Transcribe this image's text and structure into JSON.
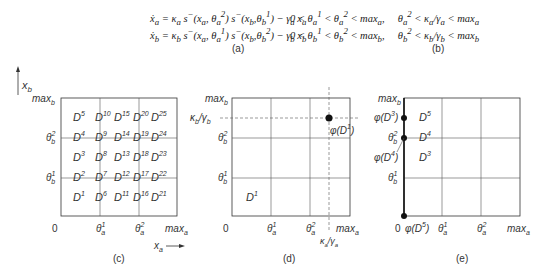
{
  "equations": {
    "a": {
      "line1": "ẋ_a = κ_a s⁻(x_a, θ_a²) s⁻(x_b, θ_b¹) − γ_a x_a",
      "line2": "ẋ_b = κ_b s⁻(x_a, θ_a¹) s⁻(x_b, θ_b²) − γ_b x_b",
      "caption": "(a)"
    },
    "b": {
      "line1": "0 < θ_a¹ < θ_a² < max_a,   θ_a² < κ_a/γ_a < max_a",
      "line2": "0 < θ_b¹ < θ_b² < max_b,   θ_b² < κ_b/γ_b < max_b",
      "caption": "(b)"
    }
  },
  "panels": {
    "c": {
      "caption": "(c)",
      "axis_x": "x_a",
      "axis_y": "x_b",
      "x_ticks": [
        "0",
        "θ_a¹",
        "θ_a²",
        "max_a"
      ],
      "y_ticks": [
        "θ_b¹",
        "θ_b²",
        "max_b"
      ],
      "domains": [
        [
          "D5",
          "D10",
          "D15",
          "D20",
          "D25"
        ],
        [
          "D4",
          "D9",
          "D14",
          "D19",
          "D24"
        ],
        [
          "D3",
          "D8",
          "D13",
          "D18",
          "D23"
        ],
        [
          "D2",
          "D7",
          "D12",
          "D17",
          "D22"
        ],
        [
          "D1",
          "D6",
          "D11",
          "D16",
          "D21"
        ]
      ]
    },
    "d": {
      "caption": "(d)",
      "x_ticks": [
        "0",
        "θ_a¹",
        "θ_a²",
        "max_a"
      ],
      "y_ticks": [
        "θ_b¹",
        "θ_b²",
        "κ_b/γ_b",
        "max_b"
      ],
      "x_extra": "κ_a/γ_a",
      "domain_label": "D1",
      "point_label": "φ(D1)"
    },
    "e": {
      "caption": "(e)",
      "x_ticks": [
        "0",
        "θ_a¹",
        "θ_a²",
        "max_a"
      ],
      "y_ticks": [
        "θ_b¹",
        "θ_b²",
        "max_b"
      ],
      "domain_labels": [
        "D5",
        "D4",
        "D3"
      ],
      "point_labels": [
        "φ(D3)",
        "φ(D4)",
        "φ(D5)"
      ]
    }
  }
}
